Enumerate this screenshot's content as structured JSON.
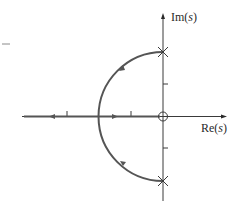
{
  "diagram": {
    "type": "root-locus",
    "axes": {
      "imag_label_prefix": "Im(",
      "imag_label_var": "s",
      "imag_label_suffix": ")",
      "real_label_prefix": "Re(",
      "real_label_var": "s",
      "real_label_suffix": ")"
    },
    "markers": {
      "poles": [
        {
          "name": "pole-upper",
          "re": 0,
          "im": 2
        },
        {
          "name": "pole-lower",
          "re": 0,
          "im": -2
        }
      ],
      "zeros": [
        {
          "name": "zero-origin",
          "re": 0,
          "im": 0
        }
      ]
    },
    "ticks": {
      "real_axis": [
        -3,
        -1
      ],
      "imag_axis": [
        1,
        -1
      ]
    },
    "locus": {
      "arc": "semicircle in left half-plane from poles at ±j2 to breakin at -2",
      "real_axis_branches": [
        "toward zero at origin",
        "toward -infinity"
      ]
    },
    "colors": {
      "axis": "#3a3a3a",
      "locus": "#555555",
      "background": "#ffffff"
    }
  }
}
